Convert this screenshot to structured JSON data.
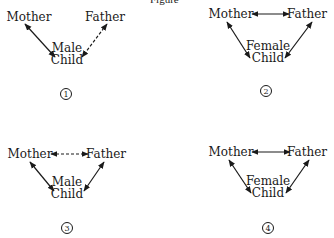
{
  "title": {
    "text": "Figure",
    "x": 150,
    "y": 3
  },
  "diagrams": [
    {
      "id": "1",
      "number": "1",
      "number_pos": [
        66,
        94
      ],
      "nodes": {
        "mother": {
          "lines": [
            "Mother"
          ],
          "x": 29,
          "y": 21
        },
        "father": {
          "lines": [
            "Father"
          ],
          "x": 105,
          "y": 21
        },
        "child": {
          "lines": [
            "Male",
            "Child"
          ],
          "x": 67,
          "y": 52
        }
      },
      "edges": [
        {
          "from": [
            25,
            24
          ],
          "to": [
            55,
            57
          ],
          "style": "solid",
          "arrows": "both"
        },
        {
          "from": [
            107,
            24
          ],
          "to": [
            82,
            57
          ],
          "style": "dashed",
          "arrows": "both"
        }
      ]
    },
    {
      "id": "2",
      "number": "2",
      "number_pos": [
        266,
        91
      ],
      "nodes": {
        "mother": {
          "lines": [
            "Mother"
          ],
          "x": 231,
          "y": 18
        },
        "father": {
          "lines": [
            "Father"
          ],
          "x": 307,
          "y": 18
        },
        "child": {
          "lines": [
            "Female",
            "Child"
          ],
          "x": 268,
          "y": 50
        }
      },
      "edges": [
        {
          "from": [
            252,
            14
          ],
          "to": [
            289,
            14
          ],
          "style": "solid",
          "arrows": "both"
        },
        {
          "from": [
            227,
            22
          ],
          "to": [
            250,
            58
          ],
          "style": "solid",
          "arrows": "both"
        },
        {
          "from": [
            312,
            22
          ],
          "to": [
            285,
            58
          ],
          "style": "solid",
          "arrows": "both"
        }
      ]
    },
    {
      "id": "3",
      "number": "3",
      "number_pos": [
        67,
        228
      ],
      "nodes": {
        "mother": {
          "lines": [
            "Mother"
          ],
          "x": 30,
          "y": 158
        },
        "father": {
          "lines": [
            "Father"
          ],
          "x": 106,
          "y": 158
        },
        "child": {
          "lines": [
            "Male",
            "Child"
          ],
          "x": 67,
          "y": 186
        }
      },
      "edges": [
        {
          "from": [
            51,
            154
          ],
          "to": [
            88,
            154
          ],
          "style": "dashed",
          "arrows": "both"
        },
        {
          "from": [
            30,
            162
          ],
          "to": [
            54,
            191
          ],
          "style": "solid",
          "arrows": "both"
        },
        {
          "from": [
            104,
            162
          ],
          "to": [
            84,
            191
          ],
          "style": "solid",
          "arrows": "both"
        }
      ]
    },
    {
      "id": "4",
      "number": "4",
      "number_pos": [
        268,
        228
      ],
      "nodes": {
        "mother": {
          "lines": [
            "Mother"
          ],
          "x": 231,
          "y": 156
        },
        "father": {
          "lines": [
            "Father"
          ],
          "x": 307,
          "y": 156
        },
        "child": {
          "lines": [
            "Female",
            "Child"
          ],
          "x": 268,
          "y": 185
        }
      },
      "edges": [
        {
          "from": [
            252,
            152
          ],
          "to": [
            290,
            152
          ],
          "style": "solid",
          "arrows": "both"
        },
        {
          "from": [
            229,
            160
          ],
          "to": [
            251,
            193
          ],
          "style": "solid",
          "arrows": "both"
        },
        {
          "from": [
            309,
            160
          ],
          "to": [
            286,
            193
          ],
          "style": "solid",
          "arrows": "both"
        }
      ]
    }
  ],
  "colors": {
    "ink": "#1a1a1a",
    "background": "#ffffff"
  }
}
